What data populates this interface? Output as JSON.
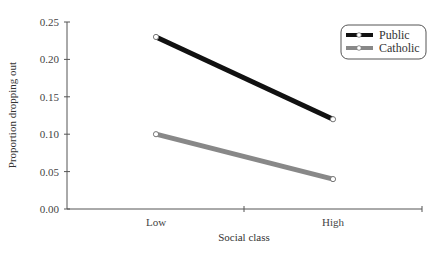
{
  "chart_data": {
    "type": "line",
    "title": "",
    "xlabel": "Social class",
    "ylabel": "Proportion dropping out",
    "categories": [
      "Low",
      "High"
    ],
    "series": [
      {
        "name": "Public",
        "values": [
          0.23,
          0.12
        ],
        "color": "#111111"
      },
      {
        "name": "Catholic",
        "values": [
          0.1,
          0.04
        ],
        "color": "#888888"
      }
    ],
    "ylim": [
      0,
      0.25
    ],
    "yticks": [
      "0.00",
      "0.05",
      "0.10",
      "0.15",
      "0.20",
      "0.25"
    ],
    "grid": false,
    "legend_position": "top-right"
  }
}
